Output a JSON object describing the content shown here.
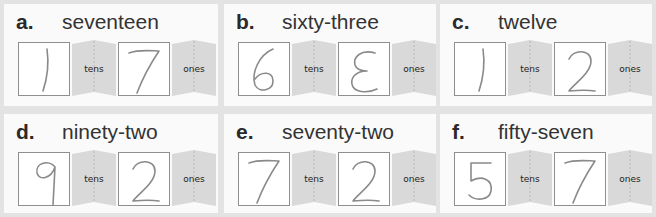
{
  "items": [
    {
      "letter": "a.",
      "word": "seventeen",
      "tens_digit": "1",
      "ones_digit": "7",
      "tens_label": "tens",
      "ones_label": "ones"
    },
    {
      "letter": "b.",
      "word": "sixty-three",
      "tens_digit": "6",
      "ones_digit": "3 (written backwards as E)",
      "tens_label": "tens",
      "ones_label": "ones"
    },
    {
      "letter": "c.",
      "word": "twelve",
      "tens_digit": "1",
      "ones_digit": "2",
      "tens_label": "tens",
      "ones_label": "ones"
    },
    {
      "letter": "d.",
      "word": "ninety-two",
      "tens_digit": "9",
      "ones_digit": "2",
      "tens_label": "tens",
      "ones_label": "ones"
    },
    {
      "letter": "e.",
      "word": "seventy-two",
      "tens_digit": "7",
      "ones_digit": "2",
      "tens_label": "tens",
      "ones_label": "ones"
    },
    {
      "letter": "f.",
      "word": "fifty-seven",
      "tens_digit": "5",
      "ones_digit": "7",
      "tens_label": "tens",
      "ones_label": "ones"
    }
  ],
  "colors": {
    "background": "#e3e3e3",
    "panel": "#fafafa",
    "tab": "#d9d9d9",
    "box_border": "#8f8f8f",
    "pencil": "#8a8a8a"
  }
}
